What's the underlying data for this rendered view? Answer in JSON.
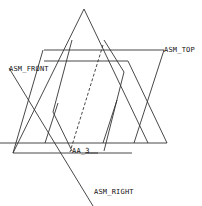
{
  "diagram": {
    "type": "datum-planes-view",
    "labels": {
      "front": "ASM_FRONT",
      "top": "ASM_TOP",
      "right": "ASM_RIGHT",
      "axis": "AA_3"
    },
    "colors": {
      "line": "#333333",
      "background": "#ffffff",
      "text": "#111111"
    }
  }
}
